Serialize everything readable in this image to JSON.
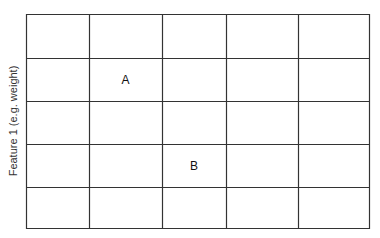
{
  "diagram": {
    "type": "grid",
    "y_axis_label": "Feature 1 (e.g. weight)",
    "grid": {
      "columns": 5,
      "rows": 5,
      "line_color": "#333333",
      "background": "#ffffff",
      "x_lines": [
        26,
        89,
        162,
        226,
        298,
        369
      ],
      "y_lines": [
        14,
        58,
        101,
        144,
        187,
        228
      ]
    },
    "points": [
      {
        "label": "A",
        "row": 1,
        "col": 1
      },
      {
        "label": "B",
        "row": 3,
        "col": 2
      }
    ]
  }
}
